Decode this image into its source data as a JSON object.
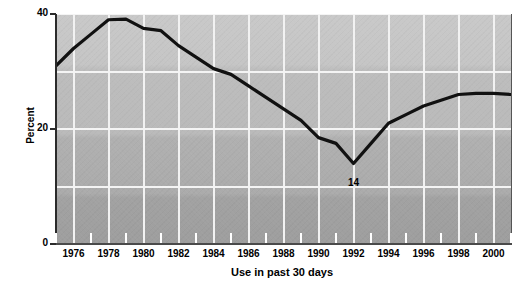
{
  "chart_data": {
    "type": "line",
    "title": "",
    "xlabel": "Use in past 30 days",
    "ylabel": "Percent",
    "xlim": [
      1975,
      2001
    ],
    "ylim": [
      0,
      40
    ],
    "grid": true,
    "legend": "none",
    "y_ticks": [
      0,
      20,
      40
    ],
    "y_gridlines": [
      10,
      20,
      30,
      40
    ],
    "x_ticks": [
      1975,
      1976,
      1977,
      1978,
      1979,
      1980,
      1981,
      1982,
      1983,
      1984,
      1985,
      1986,
      1987,
      1988,
      1989,
      1990,
      1991,
      1992,
      1993,
      1994,
      1995,
      1996,
      1997,
      1998,
      1999,
      2000,
      2001
    ],
    "x_tick_labels": [
      "",
      "1976",
      "",
      "1978",
      "",
      "1980",
      "",
      "1982",
      "",
      "1984",
      "",
      "1986",
      "",
      "1988",
      "",
      "1990",
      "",
      "1992",
      "",
      "1994",
      "",
      "1996",
      "",
      "1998",
      "",
      "2000",
      ""
    ],
    "x": [
      1975,
      1976,
      1977,
      1978,
      1979,
      1980,
      1981,
      1982,
      1983,
      1984,
      1985,
      1986,
      1987,
      1988,
      1989,
      1990,
      1991,
      1992,
      1993,
      1994,
      1995,
      1996,
      1997,
      1998,
      1999,
      2000,
      2001
    ],
    "values": [
      31,
      34,
      36.5,
      39,
      39.1,
      37.5,
      37.1,
      34.5,
      32.5,
      30.5,
      29.5,
      27.5,
      25.5,
      23.5,
      21.5,
      18.5,
      17.5,
      14,
      17.5,
      21,
      22.5,
      24,
      25,
      26,
      26.2,
      26.2,
      26
    ],
    "annotations": [
      {
        "label": "31",
        "x": 1975,
        "y": 31
      },
      {
        "label": "39",
        "x": 1978,
        "y": 39
      },
      {
        "label": "14",
        "x": 1992,
        "y": 14
      },
      {
        "label": "26",
        "x": 2001,
        "y": 26
      }
    ],
    "line_color": "#111111",
    "line_width": 3,
    "plot_background": "#b5b5b5",
    "gridline_color": "#f2f2f2"
  }
}
